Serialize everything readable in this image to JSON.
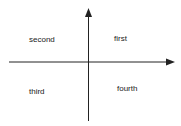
{
  "diagram": {
    "type": "quadrant",
    "axis_color": "#222222",
    "background": "#ffffff",
    "quadrants": {
      "first": "first",
      "second": "second",
      "third": "third",
      "fourth": "fourth"
    }
  }
}
